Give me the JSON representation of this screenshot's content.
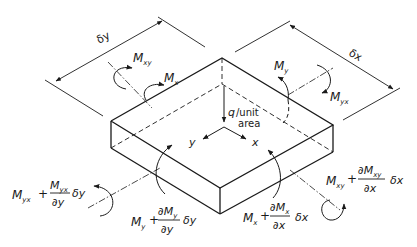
{
  "figure": {
    "type": "plate-element-moments",
    "colors": {
      "ink": "#1a1a1a",
      "background": "#ffffff"
    },
    "dimensions": {
      "dy": "δy",
      "dx": "δx"
    },
    "load": {
      "symbol": "q",
      "text1": "/unit",
      "text2": "area"
    },
    "axes": {
      "x": "x",
      "y": "y"
    },
    "moments": {
      "Mxy": {
        "base": "M",
        "sub": "xy"
      },
      "Mx": {
        "base": "M",
        "sub": "x"
      },
      "My": {
        "base": "M",
        "sub": "y"
      },
      "Myx": {
        "base": "M",
        "sub": "yx"
      }
    },
    "increments": {
      "Myx_dy": {
        "base": "M",
        "sub": "yx",
        "plus": "+",
        "num": "M",
        "num_sub": "yx",
        "den": "∂y",
        "mult": "δy"
      },
      "My_dy": {
        "base": "M",
        "sub": "y",
        "plus": "+",
        "num": "∂M",
        "num_sub": "y",
        "den": "∂y",
        "mult": "δy"
      },
      "Mx_dx": {
        "base": "M",
        "sub": "x",
        "plus": "+",
        "num": "∂M",
        "num_sub": "x",
        "den": "∂x",
        "mult": "δx"
      },
      "Mxy_dx": {
        "base": "M",
        "sub": "xy",
        "plus": "+",
        "num": "∂M",
        "num_sub": "xy",
        "den": "∂x",
        "mult": "δx"
      }
    }
  }
}
